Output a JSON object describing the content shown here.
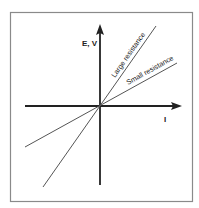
{
  "diagram": {
    "type": "ohms-law-iv-graph",
    "y_axis_label": "E, V",
    "x_axis_label": "I",
    "lines": [
      {
        "name": "large-resistance",
        "label": "Large resistance"
      },
      {
        "name": "small-resistance",
        "label": "Small resistance"
      }
    ],
    "colors": {
      "frame": "#8a8a8a",
      "axes": "#222222",
      "lines": "#555555",
      "background": "#ffffff"
    }
  }
}
